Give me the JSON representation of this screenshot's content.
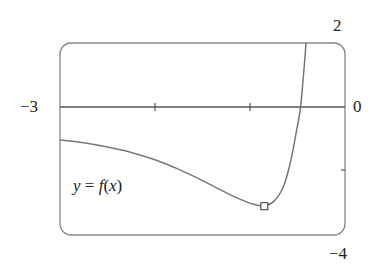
{
  "chart_data": {
    "type": "line",
    "title": "",
    "xlabel": "",
    "ylabel": "",
    "xlim": [
      -3,
      0
    ],
    "ylim": [
      -4,
      2
    ],
    "x_tick_labels": [
      "-3",
      "0"
    ],
    "y_tick_labels": [
      "2",
      "-4"
    ],
    "x_ticks": [
      -2,
      -1
    ],
    "y_ticks": [
      -2
    ],
    "grid": false,
    "legend": null,
    "annotations": [
      {
        "text": "y = f(x)",
        "x": -2.6,
        "y": -2.6
      },
      {
        "type": "marker",
        "shape": "square",
        "x": -0.85,
        "y": -3.1,
        "label": "local minimum"
      }
    ],
    "series": [
      {
        "name": "f(x)",
        "x": [
          -3.0,
          -2.75,
          -2.5,
          -2.25,
          -2.0,
          -1.75,
          -1.5,
          -1.25,
          -1.05,
          -0.95,
          -0.85,
          -0.75,
          -0.65,
          -0.58,
          -0.52,
          -0.47,
          -0.44,
          -0.41
        ],
        "values": [
          -1.03,
          -1.12,
          -1.25,
          -1.42,
          -1.65,
          -1.95,
          -2.3,
          -2.68,
          -2.95,
          -3.05,
          -3.09,
          -2.95,
          -2.5,
          -1.8,
          -0.9,
          -0.05,
          0.9,
          2.0
        ]
      }
    ]
  },
  "labels": {
    "x_min": "−3",
    "x_max": "0",
    "y_max": "2",
    "y_min": "−4",
    "function_lhs": "y",
    "function_eq": " = ",
    "function_rhs_f": "f",
    "function_rhs_paren_open": "(",
    "function_rhs_var": "x",
    "function_rhs_paren_close": ")"
  },
  "colors": {
    "axis": "#555555",
    "curve": "#777777",
    "frame": "#888888",
    "text": "#222222"
  }
}
